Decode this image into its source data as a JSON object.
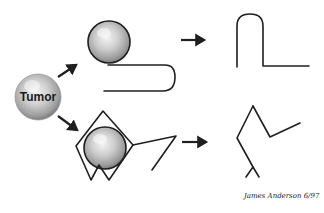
{
  "diagram": {
    "tumor": {
      "label": "Tumor"
    },
    "signature": {
      "text": "James Anderson 6/97"
    },
    "pathways": [
      {
        "name": "top",
        "description": "Tumor cell on a folded chain, transforms into a hairpin/U-shaped structure"
      },
      {
        "name": "bottom",
        "description": "Tumor cell enclosed in a diamond cage with angled chain, transforms into a zig-zag branched structure"
      }
    ],
    "colors": {
      "stroke": "#1f1f1f",
      "sphere_light": "#f2f2f2",
      "sphere_mid": "#c4c4c4",
      "sphere_dark": "#8a8a8a",
      "background": "#ffffff"
    }
  }
}
